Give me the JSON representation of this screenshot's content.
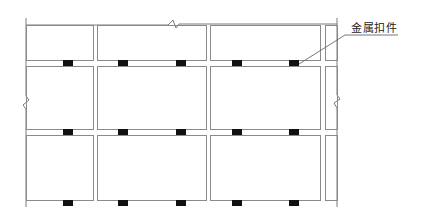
{
  "diagram": {
    "type": "elevation-detail",
    "frame": {
      "left": 26,
      "right": 337,
      "top": 25,
      "bottom": 207
    },
    "columns": [
      {
        "x1": 26,
        "x2": 93
      },
      {
        "x1": 97,
        "x2": 206
      },
      {
        "x1": 210,
        "x2": 320
      },
      {
        "x1": 325,
        "x2": 337
      }
    ],
    "rows": [
      {
        "y1": 25,
        "y2": 60
      },
      {
        "y1": 66,
        "y2": 129
      },
      {
        "y1": 135,
        "y2": 200
      }
    ],
    "clip_rows_y": [
      63,
      132,
      203
    ],
    "clip_x": [
      68,
      123,
      181,
      237,
      294
    ],
    "clip_size": {
      "w": 10,
      "h": 6
    },
    "break_marks": [
      "top",
      "left",
      "right"
    ],
    "colors": {
      "line": "#8a8a8a",
      "clip": "#111111",
      "background": "#ffffff"
    }
  },
  "labels": {
    "metal_fastener": "金属扣件"
  }
}
